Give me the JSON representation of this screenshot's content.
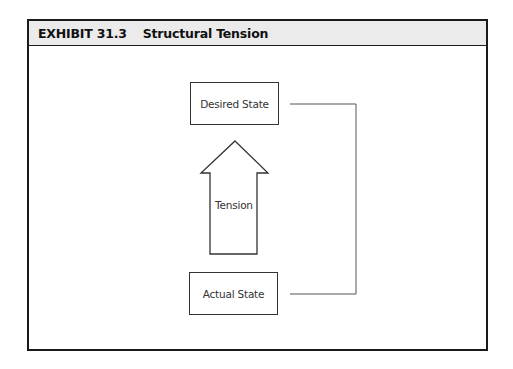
{
  "exhibit": {
    "number": "EXHIBIT 31.3",
    "title": "Structural Tension"
  },
  "diagram": {
    "top_box": {
      "label": "Desired State"
    },
    "bottom_box": {
      "label": "Actual State"
    },
    "arrow": {
      "label": "Tension",
      "direction": "up"
    },
    "connector": {
      "type": "bracket",
      "side": "right"
    }
  },
  "colors": {
    "frame": "#1a1a1a",
    "header_bg": "#ebebeb",
    "lines": "#555555"
  }
}
